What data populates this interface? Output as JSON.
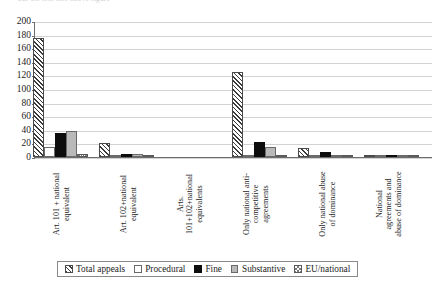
{
  "clipped_caption": "cut-off text line above figure",
  "chart_data": {
    "type": "bar",
    "title": "",
    "subtitle": "",
    "xlabel": "",
    "ylabel": "",
    "ylim": [
      0,
      200
    ],
    "ytick_step": 20,
    "yticks": [
      0,
      20,
      40,
      60,
      80,
      100,
      120,
      140,
      160,
      180,
      200
    ],
    "grid": true,
    "legend_position": "bottom",
    "categories": [
      "Art. 101 + national\nequivalent",
      "Art. 102+national\nequivalent",
      "Arts.\n101+102+national\nequivalents",
      "Only national anti-\ncompetitive\nagreements",
      "Only national abuse\nof dominance",
      "National\nagreements and\nabuse of dominance"
    ],
    "series": [
      {
        "name": "Total appeals",
        "pattern": "diagonal-hatch",
        "values": [
          175,
          20,
          0,
          125,
          13,
          2
        ]
      },
      {
        "name": "Procedural",
        "pattern": "white",
        "values": [
          14,
          3,
          0,
          3,
          1,
          1
        ]
      },
      {
        "name": "Fine",
        "pattern": "solid-black",
        "values": [
          35,
          4,
          0,
          22,
          8,
          2
        ]
      },
      {
        "name": "Substantive",
        "pattern": "solid-gray",
        "values": [
          38,
          4,
          0,
          14,
          2,
          1
        ]
      },
      {
        "name": "EU/national",
        "pattern": "cross-hatch",
        "values": [
          5,
          2,
          0,
          2,
          1,
          2
        ]
      }
    ]
  },
  "legend": {
    "items": [
      {
        "label": "Total appeals",
        "swatch": "diagonal-hatch-swatch"
      },
      {
        "label": "Procedural",
        "swatch": "white-swatch"
      },
      {
        "label": "Fine",
        "swatch": "black-swatch"
      },
      {
        "label": "Substantive",
        "swatch": "gray-swatch"
      },
      {
        "label": "EU/national",
        "swatch": "cross-hatch-swatch"
      }
    ]
  },
  "colors": {
    "axis": "#6e6e6e",
    "grid": "#d2d2d2",
    "fine": "#0d0d0d",
    "substantive": "#b9b9b9",
    "background": "#ffffff"
  }
}
